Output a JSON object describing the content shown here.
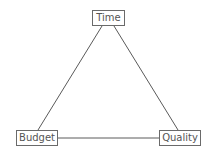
{
  "diagram": {
    "nodes": [
      {
        "id": "time",
        "label": "Time"
      },
      {
        "id": "budget",
        "label": "Budget"
      },
      {
        "id": "quality",
        "label": "Quality"
      }
    ],
    "edges": [
      {
        "from": "time",
        "to": "budget"
      },
      {
        "from": "time",
        "to": "quality"
      },
      {
        "from": "budget",
        "to": "quality"
      }
    ]
  }
}
